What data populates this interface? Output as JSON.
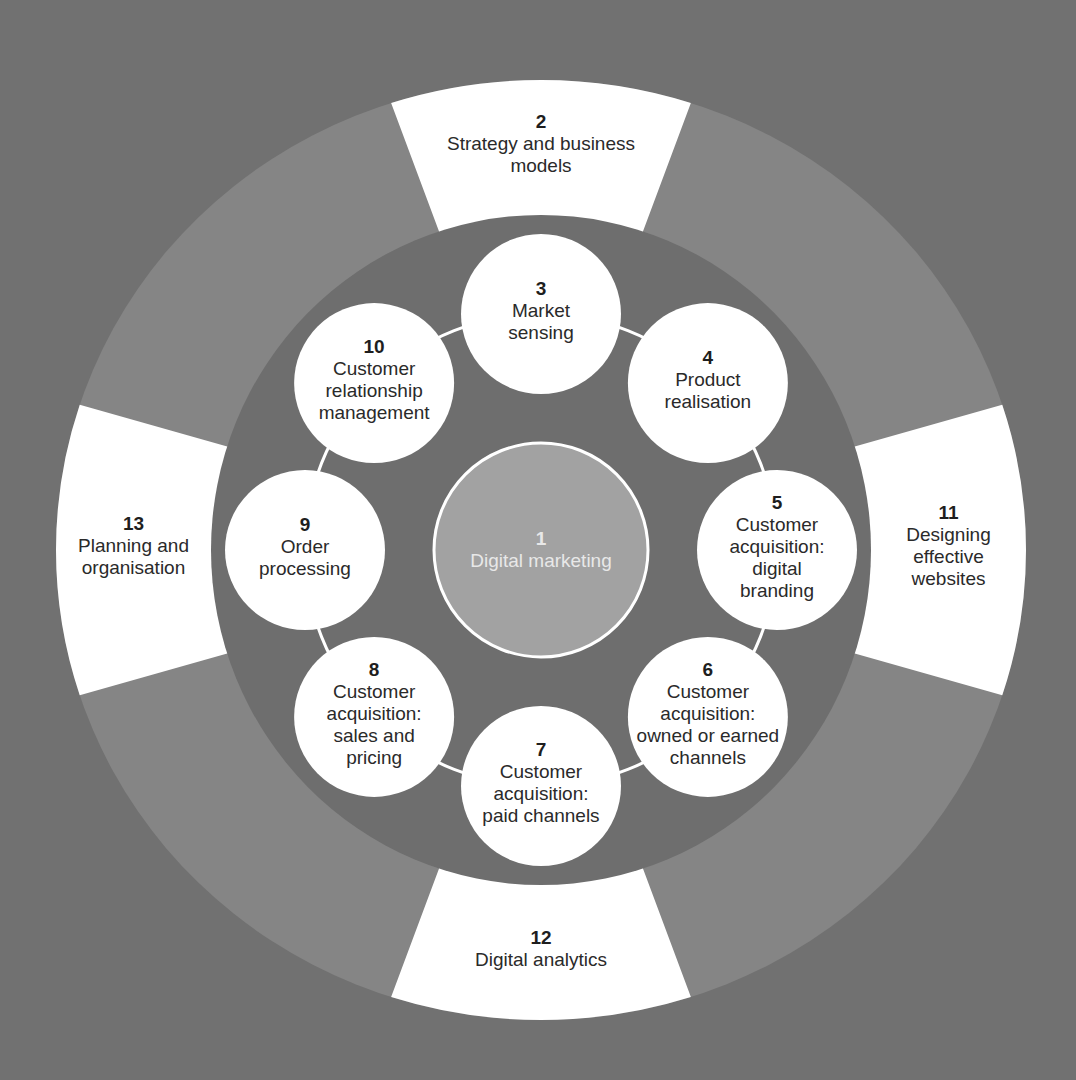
{
  "colors": {
    "background": "#717171",
    "outer_ring": "#858585",
    "inner_disk": "#6e6e6e",
    "center_circle": "#a2a2a2",
    "node_fill": "#ffffff",
    "text_dark": "#2a2a2a",
    "text_light": "#e8e8e8"
  },
  "center": {
    "number": "1",
    "label": [
      "Digital marketing"
    ]
  },
  "inner_nodes": [
    {
      "number": "3",
      "label": [
        "Market",
        "sensing"
      ],
      "angle_deg": -90
    },
    {
      "number": "4",
      "label": [
        "Product",
        "realisation"
      ],
      "angle_deg": -45
    },
    {
      "number": "5",
      "label": [
        "Customer",
        "acquisition:",
        "digital",
        "branding"
      ],
      "angle_deg": 0
    },
    {
      "number": "6",
      "label": [
        "Customer",
        "acquisition:",
        "owned or earned",
        "channels"
      ],
      "angle_deg": 45
    },
    {
      "number": "7",
      "label": [
        "Customer",
        "acquisition:",
        "paid channels"
      ],
      "angle_deg": 90
    },
    {
      "number": "8",
      "label": [
        "Customer",
        "acquisition:",
        "sales and",
        "pricing"
      ],
      "angle_deg": 135
    },
    {
      "number": "9",
      "label": [
        "Order",
        "processing"
      ],
      "angle_deg": 180
    },
    {
      "number": "10",
      "label": [
        "Customer",
        "relationship",
        "management"
      ],
      "angle_deg": 225
    }
  ],
  "outer_segments": [
    {
      "number": "2",
      "label": [
        "Strategy and business",
        "models"
      ],
      "angle_deg": -90
    },
    {
      "number": "11",
      "label": [
        "Designing",
        "effective",
        "websites"
      ],
      "angle_deg": 0
    },
    {
      "number": "12",
      "label": [
        "Digital analytics"
      ],
      "angle_deg": 90
    },
    {
      "number": "13",
      "label": [
        "Planning and",
        "organisation"
      ],
      "angle_deg": 180
    }
  ]
}
